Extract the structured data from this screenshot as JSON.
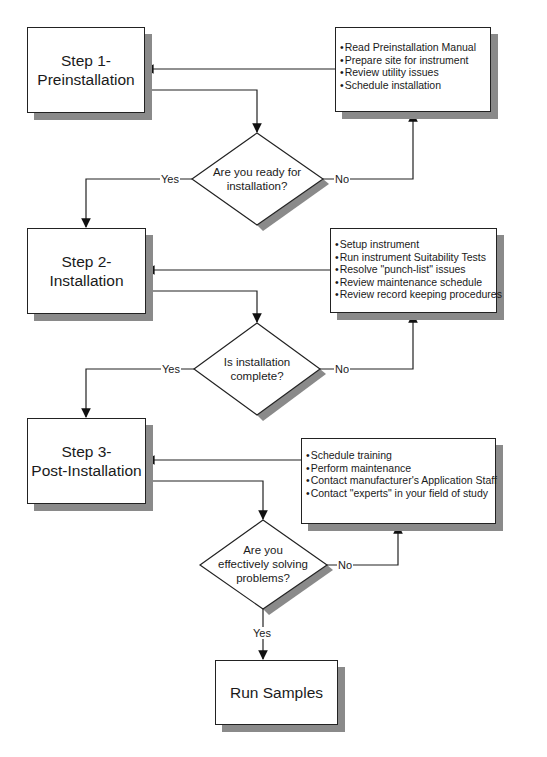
{
  "steps": [
    {
      "line1": "Step 1-",
      "line2": "Preinstallation"
    },
    {
      "line1": "Step 2-",
      "line2": "Installation"
    },
    {
      "line1": "Step 3-",
      "line2": "Post-Installation"
    }
  ],
  "final": {
    "label": "Run Samples"
  },
  "decisions": [
    {
      "line1": "Are you ready for",
      "line2": "installation?",
      "line3": ""
    },
    {
      "line1": "Is installation",
      "line2": "complete?",
      "line3": ""
    },
    {
      "line1": "Are you",
      "line2": "effectively solving",
      "line3": "problems?"
    }
  ],
  "branch_labels": {
    "yes": "Yes",
    "no": "No"
  },
  "info_boxes": [
    {
      "items": [
        "Read Preinstallation Manual",
        "Prepare site for instrument",
        "Review utility issues",
        "Schedule installation"
      ]
    },
    {
      "items": [
        "Setup instrument",
        "Run instrument Suitability Tests",
        "Resolve \"punch-list\" issues",
        "Review maintenance schedule",
        "Review record keeping procedures"
      ]
    },
    {
      "items": [
        "Schedule training",
        "Perform maintenance",
        "Contact manufacturer's Application Staff",
        "Contact \"experts\" in your field of study"
      ]
    }
  ],
  "colors": {
    "line": "#222222",
    "shadow": "#8a8a8a",
    "fill": "#ffffff"
  }
}
